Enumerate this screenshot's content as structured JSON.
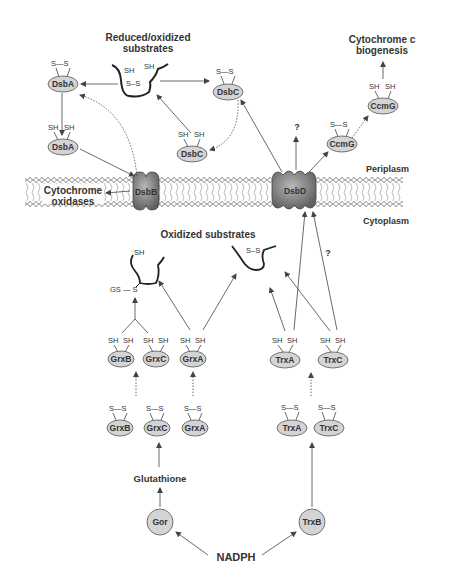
{
  "colors": {
    "text": "#333333",
    "line": "#444444",
    "protein_fill": "#d4d4d4",
    "membrane_protein_fill": "#8a8a8a",
    "membrane_head": "#ffffff"
  },
  "compartments": {
    "periplasm": "Periplasm",
    "cytoplasm": "Cytoplasm"
  },
  "labels": {
    "reduced_oxidized_line1": "Reduced/oxidized",
    "reduced_oxidized_line2": "substrates",
    "cyt_c_line1": "Cytochrome c",
    "cyt_c_line2": "biogenesis",
    "cyt_oxidases_line1": "Cytochrome",
    "cyt_oxidases_line2": "oxidases",
    "oxidized_substrates": "Oxidized substrates",
    "glutathione": "Glutathione",
    "nadph": "NADPH",
    "question1": "?",
    "question2": "?"
  },
  "groups": {
    "ss": "S—S",
    "sh": "SH",
    "gs_s": "GS — S",
    "s_s_inline": "S–S"
  },
  "proteins": {
    "dsbA_ox": "DsbA",
    "dsbA_red": "DsbA",
    "dsbC_ox": "DsbC",
    "dsbC_red": "DsbC",
    "ccmG_ox": "CcmG",
    "ccmG_red": "CcmG",
    "dsbB": "DsbB",
    "dsbD": "DsbD",
    "grxB_red": "GrxB",
    "grxC_red": "GrxC",
    "grxA_red": "GrxA",
    "grxB_ox": "GrxB",
    "grxC_ox": "GrxC",
    "grxA_ox": "GrxA",
    "trxA_red": "TrxA",
    "trxC_red": "TrxC",
    "trxA_ox": "TrxA",
    "trxC_ox": "TrxC",
    "gor": "Gor",
    "trxB": "TrxB"
  }
}
